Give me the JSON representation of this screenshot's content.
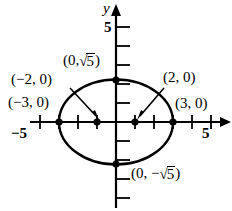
{
  "figure": {
    "kind": "coordinate-graph",
    "background": "#ffffff",
    "ink_color": "#000000",
    "width": 232,
    "height": 211
  },
  "axes": {
    "x_axis_name": "",
    "y_axis_name": "y",
    "x_tick_labels": [
      {
        "text": "−5",
        "value": -5
      },
      {
        "text": "5",
        "value": 5
      }
    ],
    "y_tick_labels": [
      {
        "text": "5",
        "value": 5
      }
    ],
    "origin_px": {
      "x": 116,
      "y": 122
    },
    "unit_px": 19,
    "x_range": [
      -6,
      6
    ],
    "y_range": [
      -5,
      5.5
    ]
  },
  "curve": {
    "type": "ellipse",
    "center": [
      0,
      0
    ],
    "semi_axis_x": 3,
    "semi_axis_y": 2.236,
    "x_intercepts": [
      -3,
      3
    ],
    "y_intercepts": [
      -2.236,
      2.236
    ]
  },
  "points": [
    {
      "label_text": "(−3, 0)",
      "x": -3,
      "y": 0,
      "marker": true
    },
    {
      "label_text": "(−2, 0)",
      "x": -2,
      "y": 0,
      "marker": true
    },
    {
      "label_text": "(2, 0)",
      "x": 2,
      "y": 0,
      "marker": true
    },
    {
      "label_text": "(3, 0)",
      "x": 3,
      "y": 0,
      "marker": true
    }
  ],
  "labels": {
    "top_point": {
      "prefix": "(0,",
      "radicand": "5",
      "suffix": ")"
    },
    "bottom_point": {
      "prefix": "(0, −",
      "radicand": "5",
      "suffix": ")"
    },
    "left_outer": "(−3, 0)",
    "left_inner": "(−2, 0)",
    "right_inner": "(2, 0)",
    "right_outer": "(3, 0)"
  }
}
